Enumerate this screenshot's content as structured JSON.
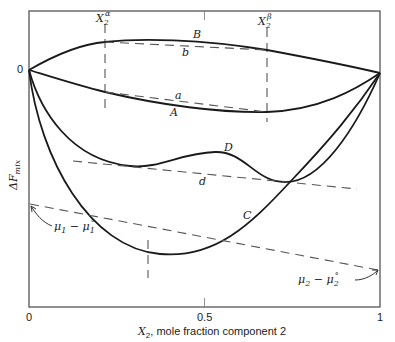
{
  "diagram": {
    "type": "free-energy-of-mixing-vs-composition",
    "y_axis_label": {
      "main": "ΔF",
      "sub": "mix"
    },
    "x_axis_label": {
      "var": "X",
      "sub": "2",
      "rest": ", mole fraction component 2"
    },
    "x_ticks": [
      "0",
      "0.5",
      "1"
    ],
    "y_origin_label": "0",
    "phase_markers": [
      {
        "name": "alpha",
        "var": "X",
        "sub": "2",
        "sup": "α"
      },
      {
        "name": "beta",
        "var": "X",
        "sub": "2",
        "sup": "β"
      }
    ],
    "curves": [
      {
        "id": "A",
        "label": "A",
        "style": "solid"
      },
      {
        "id": "B",
        "label": "B",
        "style": "solid"
      },
      {
        "id": "C",
        "label": "C",
        "style": "solid"
      },
      {
        "id": "D",
        "label": "D",
        "style": "solid"
      }
    ],
    "tangent_lines": [
      {
        "id": "a",
        "label": "a",
        "style": "dashed"
      },
      {
        "id": "b",
        "label": "b",
        "style": "dashed"
      },
      {
        "id": "d",
        "label": "d",
        "style": "dashed"
      }
    ],
    "intercept_labels": {
      "mu1": {
        "mu": "μ",
        "sub1": "1",
        "minus": " − ",
        "mu2": "μ",
        "sub2": "1",
        "sup": "°"
      },
      "mu2": {
        "mu": "μ",
        "sub1": "2",
        "minus": " − ",
        "mu2": "μ",
        "sub2": "2",
        "sup": "°"
      }
    }
  }
}
